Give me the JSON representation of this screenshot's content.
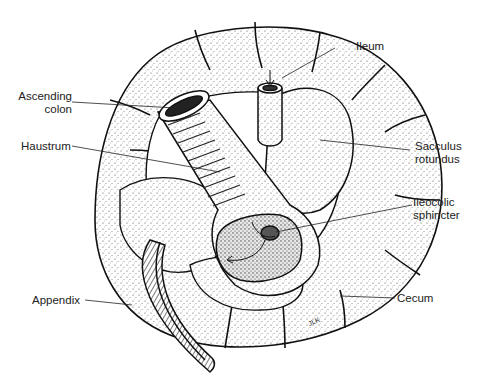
{
  "figure": {
    "signature": "JLK",
    "labels": {
      "ileum": "Ileum",
      "ascending_colon_1": "Ascending",
      "ascending_colon_2": "colon",
      "haustrum": "Haustrum",
      "sacculus_1": "Sacculus",
      "sacculus_2": "rotundus",
      "ileocolic_1": "Ileocolic",
      "ileocolic_2": "sphincter",
      "appendix": "Appendix",
      "cecum": "Cecum"
    }
  }
}
